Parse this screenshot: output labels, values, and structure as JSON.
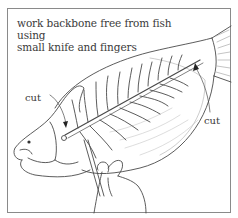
{
  "illustration": {
    "subject": "filleting a fish - removing backbone",
    "caption_line1": "work backbone free from fish using",
    "caption_line2": "small knife and fingers",
    "labels": {
      "cut_left": "cut",
      "cut_right": "cut"
    },
    "icons": {
      "fish": "fish-illustration",
      "backbone": "backbone-illustration",
      "hand": "hand-illustration",
      "knife": "knife-illustration",
      "arrows": "cut-arrow-icon"
    },
    "colors": {
      "ink": "#3a3a3a",
      "frame": "#8a8a8a",
      "background": "#ffffff"
    }
  }
}
